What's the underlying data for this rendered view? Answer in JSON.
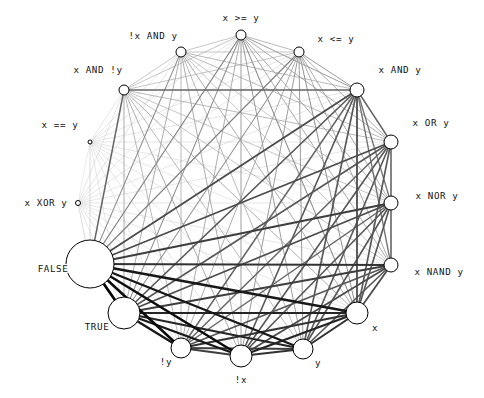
{
  "figure": {
    "title": "",
    "background_color": "#ffffff",
    "layout": "circular",
    "center_x": 241,
    "center_y": 203,
    "radius": 150
  },
  "chart_data": {
    "type": "network-graph",
    "title": "",
    "xlabel": "",
    "ylabel": "",
    "layout": "circular",
    "grid": false,
    "legend": "none",
    "node_color": "#ffffff",
    "node_edge_color": "#000000",
    "edge_color_dark": "#000000",
    "edge_color_light": "#c8c8c8",
    "nodes": [
      {
        "id": "x >= y",
        "label": "x >= y",
        "angle": -90,
        "size": 10,
        "cx": 241,
        "cy": 35,
        "r": 5,
        "label_x": 241,
        "label_y": 21,
        "label_anchor": "middle"
      },
      {
        "id": "x <= y",
        "label": "x <= y",
        "angle": -67.5,
        "size": 10,
        "cx": 299,
        "cy": 52,
        "r": 5,
        "label_x": 336,
        "label_y": 42,
        "label_anchor": "middle"
      },
      {
        "id": "x AND y",
        "label": "x AND y",
        "angle": -45,
        "size": 14,
        "cx": 357,
        "cy": 90,
        "r": 7,
        "label_x": 400,
        "label_y": 73,
        "label_anchor": "middle"
      },
      {
        "id": "x OR y",
        "label": "x OR y",
        "angle": -22.5,
        "size": 14,
        "cx": 391,
        "cy": 142,
        "r": 7,
        "label_x": 431,
        "label_y": 126,
        "label_anchor": "middle"
      },
      {
        "id": "x NOR y",
        "label": "x NOR y",
        "angle": 0,
        "size": 14,
        "cx": 391,
        "cy": 203,
        "r": 7,
        "label_x": 437,
        "label_y": 199,
        "label_anchor": "middle"
      },
      {
        "id": "x NAND y",
        "label": "x NAND y",
        "angle": 22.5,
        "size": 14,
        "cx": 391,
        "cy": 265,
        "r": 7,
        "label_x": 439,
        "label_y": 275,
        "label_anchor": "middle"
      },
      {
        "id": "x",
        "label": "x",
        "angle": 45,
        "size": 22,
        "cx": 357,
        "cy": 313,
        "r": 11,
        "label_x": 375,
        "label_y": 331,
        "label_anchor": "middle"
      },
      {
        "id": "y",
        "label": "y",
        "angle": 67.5,
        "size": 20,
        "cx": 303,
        "cy": 349,
        "r": 10,
        "label_x": 318,
        "label_y": 366,
        "label_anchor": "middle"
      },
      {
        "id": "!x",
        "label": "!x",
        "angle": 90,
        "size": 22,
        "cx": 241,
        "cy": 356,
        "r": 11,
        "label_x": 241,
        "label_y": 383,
        "label_anchor": "middle"
      },
      {
        "id": "!y",
        "label": "!y",
        "angle": 112.5,
        "size": 20,
        "cx": 181,
        "cy": 348,
        "r": 10,
        "label_x": 166,
        "label_y": 365,
        "label_anchor": "middle"
      },
      {
        "id": "TRUE",
        "label": "TRUE",
        "angle": 135,
        "size": 32,
        "cx": 124,
        "cy": 313,
        "r": 16,
        "label_x": 97,
        "label_y": 330,
        "label_anchor": "middle"
      },
      {
        "id": "FALSE",
        "label": "FALSE",
        "angle": 157.5,
        "size": 48,
        "cx": 90,
        "cy": 264,
        "r": 24,
        "label_x": 53,
        "label_y": 272,
        "label_anchor": "middle"
      },
      {
        "id": "x XOR y",
        "label": "x XOR y",
        "angle": 180,
        "size": 5,
        "cx": 78,
        "cy": 203,
        "r": 2.5,
        "label_x": 46,
        "label_y": 206,
        "label_anchor": "middle"
      },
      {
        "id": "x == y",
        "label": "x == y",
        "angle": 202.5,
        "size": 4,
        "cx": 90,
        "cy": 142,
        "r": 2,
        "label_x": 60,
        "label_y": 128,
        "label_anchor": "middle"
      },
      {
        "id": "x AND !y",
        "label": "x AND !y",
        "angle": 225,
        "size": 10,
        "cx": 124,
        "cy": 90,
        "r": 5,
        "label_x": 98,
        "label_y": 73,
        "label_anchor": "middle"
      },
      {
        "id": "!x AND y",
        "label": "!x AND y",
        "angle": 247.5,
        "size": 10,
        "cx": 181,
        "cy": 52,
        "r": 5,
        "label_x": 153,
        "label_y": 39,
        "label_anchor": "middle"
      }
    ],
    "edge_description": "complete graph: every node pair connected; line width and darkness encode edge weight",
    "edges": [
      {
        "source": "FALSE",
        "target": "TRUE",
        "weight": 3.2
      },
      {
        "source": "FALSE",
        "target": "!y",
        "weight": 3.0
      },
      {
        "source": "FALSE",
        "target": "!x",
        "weight": 3.0
      },
      {
        "source": "FALSE",
        "target": "y",
        "weight": 2.8
      },
      {
        "source": "FALSE",
        "target": "x",
        "weight": 2.8
      },
      {
        "source": "FALSE",
        "target": "x NAND y",
        "weight": 2.4
      },
      {
        "source": "FALSE",
        "target": "x NOR y",
        "weight": 2.2
      },
      {
        "source": "FALSE",
        "target": "x OR y",
        "weight": 2.0
      },
      {
        "source": "FALSE",
        "target": "x AND y",
        "weight": 2.0
      },
      {
        "source": "FALSE",
        "target": "x <= y",
        "weight": 1.2
      },
      {
        "source": "FALSE",
        "target": "x >= y",
        "weight": 1.2
      },
      {
        "source": "FALSE",
        "target": "!x AND y",
        "weight": 1.0
      },
      {
        "source": "FALSE",
        "target": "x AND !y",
        "weight": 1.6
      },
      {
        "source": "FALSE",
        "target": "x == y",
        "weight": 0.4
      },
      {
        "source": "FALSE",
        "target": "x XOR y",
        "weight": 0.4
      },
      {
        "source": "TRUE",
        "target": "!y",
        "weight": 2.8
      },
      {
        "source": "TRUE",
        "target": "!x",
        "weight": 2.8
      },
      {
        "source": "TRUE",
        "target": "y",
        "weight": 2.6
      },
      {
        "source": "TRUE",
        "target": "x",
        "weight": 2.6
      },
      {
        "source": "TRUE",
        "target": "x NAND y",
        "weight": 2.2
      },
      {
        "source": "TRUE",
        "target": "x NOR y",
        "weight": 2.0
      },
      {
        "source": "TRUE",
        "target": "x OR y",
        "weight": 1.8
      },
      {
        "source": "TRUE",
        "target": "x AND y",
        "weight": 1.8
      },
      {
        "source": "TRUE",
        "target": "x <= y",
        "weight": 1.0
      },
      {
        "source": "TRUE",
        "target": "x >= y",
        "weight": 1.0
      },
      {
        "source": "TRUE",
        "target": "!x AND y",
        "weight": 0.8
      },
      {
        "source": "TRUE",
        "target": "x AND !y",
        "weight": 0.8
      },
      {
        "source": "TRUE",
        "target": "x == y",
        "weight": 0.3
      },
      {
        "source": "TRUE",
        "target": "x XOR y",
        "weight": 0.3
      },
      {
        "source": "x",
        "target": "!x",
        "weight": 2.6
      },
      {
        "source": "x",
        "target": "y",
        "weight": 2.4
      },
      {
        "source": "x",
        "target": "!y",
        "weight": 2.4
      },
      {
        "source": "x",
        "target": "x NAND y",
        "weight": 2.0
      },
      {
        "source": "x",
        "target": "x NOR y",
        "weight": 1.8
      },
      {
        "source": "x",
        "target": "x OR y",
        "weight": 1.8
      },
      {
        "source": "x",
        "target": "x AND y",
        "weight": 2.0
      },
      {
        "source": "x",
        "target": "x <= y",
        "weight": 1.0
      },
      {
        "source": "x",
        "target": "x >= y",
        "weight": 1.0
      },
      {
        "source": "x",
        "target": "!x AND y",
        "weight": 0.8
      },
      {
        "source": "x",
        "target": "x AND !y",
        "weight": 0.8
      },
      {
        "source": "x",
        "target": "x == y",
        "weight": 0.3
      },
      {
        "source": "x",
        "target": "x XOR y",
        "weight": 0.3
      },
      {
        "source": "!x",
        "target": "y",
        "weight": 2.4
      },
      {
        "source": "!x",
        "target": "!y",
        "weight": 2.2
      },
      {
        "source": "!x",
        "target": "x NAND y",
        "weight": 2.0
      },
      {
        "source": "!x",
        "target": "x NOR y",
        "weight": 1.8
      },
      {
        "source": "!x",
        "target": "x OR y",
        "weight": 1.8
      },
      {
        "source": "!x",
        "target": "x AND y",
        "weight": 1.8
      },
      {
        "source": "!x",
        "target": "x <= y",
        "weight": 0.9
      },
      {
        "source": "!x",
        "target": "x >= y",
        "weight": 0.9
      },
      {
        "source": "!x",
        "target": "!x AND y",
        "weight": 0.8
      },
      {
        "source": "!x",
        "target": "x AND !y",
        "weight": 0.8
      },
      {
        "source": "!x",
        "target": "x == y",
        "weight": 0.3
      },
      {
        "source": "!x",
        "target": "x XOR y",
        "weight": 0.3
      },
      {
        "source": "y",
        "target": "!y",
        "weight": 2.2
      },
      {
        "source": "y",
        "target": "x NAND y",
        "weight": 1.8
      },
      {
        "source": "y",
        "target": "x NOR y",
        "weight": 1.8
      },
      {
        "source": "y",
        "target": "x OR y",
        "weight": 1.8
      },
      {
        "source": "y",
        "target": "x AND y",
        "weight": 1.8
      },
      {
        "source": "y",
        "target": "x <= y",
        "weight": 0.9
      },
      {
        "source": "y",
        "target": "x >= y",
        "weight": 0.9
      },
      {
        "source": "y",
        "target": "!x AND y",
        "weight": 0.7
      },
      {
        "source": "y",
        "target": "x AND !y",
        "weight": 0.7
      },
      {
        "source": "y",
        "target": "x == y",
        "weight": 0.3
      },
      {
        "source": "y",
        "target": "x XOR y",
        "weight": 0.3
      },
      {
        "source": "!y",
        "target": "x NAND y",
        "weight": 1.8
      },
      {
        "source": "!y",
        "target": "x NOR y",
        "weight": 1.6
      },
      {
        "source": "!y",
        "target": "x OR y",
        "weight": 1.6
      },
      {
        "source": "!y",
        "target": "x AND y",
        "weight": 1.6
      },
      {
        "source": "!y",
        "target": "x <= y",
        "weight": 0.8
      },
      {
        "source": "!y",
        "target": "x >= y",
        "weight": 0.8
      },
      {
        "source": "!y",
        "target": "!x AND y",
        "weight": 0.7
      },
      {
        "source": "!y",
        "target": "x AND !y",
        "weight": 0.7
      },
      {
        "source": "!y",
        "target": "x == y",
        "weight": 0.3
      },
      {
        "source": "!y",
        "target": "x XOR y",
        "weight": 0.3
      },
      {
        "source": "x AND y",
        "target": "x OR y",
        "weight": 1.6
      },
      {
        "source": "x AND y",
        "target": "x NOR y",
        "weight": 1.4
      },
      {
        "source": "x AND y",
        "target": "x NAND y",
        "weight": 1.4
      },
      {
        "source": "x AND y",
        "target": "x <= y",
        "weight": 0.9
      },
      {
        "source": "x AND y",
        "target": "x >= y",
        "weight": 0.9
      },
      {
        "source": "x AND y",
        "target": "!x AND y",
        "weight": 0.7
      },
      {
        "source": "x AND y",
        "target": "x AND !y",
        "weight": 1.6
      },
      {
        "source": "x AND y",
        "target": "x == y",
        "weight": 0.3
      },
      {
        "source": "x AND y",
        "target": "x XOR y",
        "weight": 0.3
      },
      {
        "source": "x OR y",
        "target": "x NOR y",
        "weight": 1.4
      },
      {
        "source": "x OR y",
        "target": "x NAND y",
        "weight": 1.4
      },
      {
        "source": "x OR y",
        "target": "x <= y",
        "weight": 0.8
      },
      {
        "source": "x OR y",
        "target": "x >= y",
        "weight": 0.8
      },
      {
        "source": "x OR y",
        "target": "!x AND y",
        "weight": 0.7
      },
      {
        "source": "x OR y",
        "target": "x AND !y",
        "weight": 0.7
      },
      {
        "source": "x OR y",
        "target": "x == y",
        "weight": 0.3
      },
      {
        "source": "x OR y",
        "target": "x XOR y",
        "weight": 0.3
      },
      {
        "source": "x NOR y",
        "target": "x NAND y",
        "weight": 1.4
      },
      {
        "source": "x NOR y",
        "target": "x <= y",
        "weight": 0.8
      },
      {
        "source": "x NOR y",
        "target": "x >= y",
        "weight": 0.8
      },
      {
        "source": "x NOR y",
        "target": "!x AND y",
        "weight": 0.6
      },
      {
        "source": "x NOR y",
        "target": "x AND !y",
        "weight": 0.6
      },
      {
        "source": "x NOR y",
        "target": "x == y",
        "weight": 0.3
      },
      {
        "source": "x NOR y",
        "target": "x XOR y",
        "weight": 0.3
      },
      {
        "source": "x NAND y",
        "target": "x <= y",
        "weight": 0.8
      },
      {
        "source": "x NAND y",
        "target": "x >= y",
        "weight": 0.8
      },
      {
        "source": "x NAND y",
        "target": "!x AND y",
        "weight": 0.6
      },
      {
        "source": "x NAND y",
        "target": "x AND !y",
        "weight": 0.6
      },
      {
        "source": "x NAND y",
        "target": "x == y",
        "weight": 0.3
      },
      {
        "source": "x NAND y",
        "target": "x XOR y",
        "weight": 0.3
      },
      {
        "source": "x <= y",
        "target": "x >= y",
        "weight": 0.7
      },
      {
        "source": "x <= y",
        "target": "!x AND y",
        "weight": 0.6
      },
      {
        "source": "x <= y",
        "target": "x AND !y",
        "weight": 0.6
      },
      {
        "source": "x <= y",
        "target": "x == y",
        "weight": 0.3
      },
      {
        "source": "x <= y",
        "target": "x XOR y",
        "weight": 0.3
      },
      {
        "source": "x >= y",
        "target": "!x AND y",
        "weight": 0.6
      },
      {
        "source": "x >= y",
        "target": "x AND !y",
        "weight": 0.6
      },
      {
        "source": "x >= y",
        "target": "x == y",
        "weight": 0.3
      },
      {
        "source": "x >= y",
        "target": "x XOR y",
        "weight": 0.3
      },
      {
        "source": "!x AND y",
        "target": "x AND !y",
        "weight": 0.6
      },
      {
        "source": "!x AND y",
        "target": "x == y",
        "weight": 0.3
      },
      {
        "source": "!x AND y",
        "target": "x XOR y",
        "weight": 0.3
      },
      {
        "source": "x AND !y",
        "target": "x == y",
        "weight": 0.3
      },
      {
        "source": "x AND !y",
        "target": "x XOR y",
        "weight": 0.3
      },
      {
        "source": "x == y",
        "target": "x XOR y",
        "weight": 0.25
      }
    ]
  }
}
